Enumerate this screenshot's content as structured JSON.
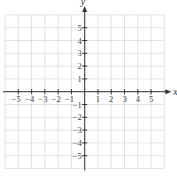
{
  "chart_data": {
    "type": "scatter",
    "title": "",
    "xlabel": "x",
    "ylabel": "y",
    "xlim": [
      -6,
      6
    ],
    "ylim": [
      -6,
      6
    ],
    "grid": true,
    "x_ticks": [
      -5,
      -4,
      -3,
      -2,
      -1,
      1,
      2,
      3,
      4,
      5
    ],
    "y_ticks": [
      -5,
      -4,
      -3,
      -2,
      -1,
      1,
      2,
      3,
      4,
      5
    ],
    "x_tick_labels": [
      "−5",
      "−4",
      "−3",
      "−2",
      "−1",
      "1",
      "2",
      "3",
      "4",
      "5"
    ],
    "y_tick_labels": [
      "−5",
      "−4",
      "−3",
      "−2",
      "−1",
      "1",
      "2",
      "3",
      "4",
      "5"
    ],
    "series": []
  },
  "axes": {
    "x_label": "x",
    "y_label": "y"
  }
}
